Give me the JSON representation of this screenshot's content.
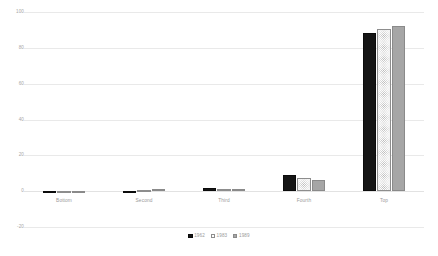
{
  "chart_data": {
    "type": "bar",
    "title": "",
    "subtitle": "",
    "xlabel": "",
    "ylabel": "",
    "ylim": [
      -20,
      100
    ],
    "yticks": [
      100,
      80,
      60,
      40,
      20,
      0,
      -20
    ],
    "ytick_labels": [
      "100",
      "80",
      "60",
      "40",
      "20",
      "0",
      "-20"
    ],
    "grid": true,
    "legend_position": "bottom",
    "categories": [
      "Bottom",
      "Second",
      "Third",
      "Fourth",
      "Top"
    ],
    "series": [
      {
        "name": "1962",
        "values": [
          -0.7,
          0.1,
          2.0,
          9.0,
          88.5
        ]
      },
      {
        "name": "1983",
        "values": [
          -0.5,
          0.6,
          1.0,
          7.6,
          90.5
        ]
      },
      {
        "name": "1989",
        "values": [
          -1.1,
          1.0,
          1.1,
          6.5,
          92.0
        ]
      }
    ]
  },
  "legend": {
    "items": [
      {
        "label": "1962"
      },
      {
        "label": "1983"
      },
      {
        "label": "1989"
      }
    ]
  },
  "colors": {
    "series_1962": "#151515",
    "series_1983": "#fdfdfd",
    "series_1989": "#a6a6a6",
    "gridline": "#e9e9e9",
    "tick_text": "#a6a6a6",
    "background": "#ffffff"
  }
}
